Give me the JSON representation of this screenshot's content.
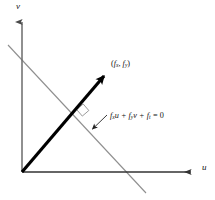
{
  "figure": {
    "width": 215,
    "height": 200,
    "background_color": "#ffffff"
  },
  "axes": {
    "vertical": {
      "label": "v",
      "color": "#6b6b6b",
      "origin": [
        22,
        172
      ],
      "tip": [
        22,
        18
      ],
      "has_arrowhead": true
    },
    "horizontal": {
      "label": "u",
      "color": "#333333",
      "origin": [
        22,
        172
      ],
      "tip": [
        196,
        172
      ],
      "has_arrowhead": true
    }
  },
  "vector": {
    "name": "gradient-vector",
    "label_open_paren": "(",
    "label_f": "f",
    "label_sub_x": "x",
    "label_comma": ", ",
    "label_f2": "f",
    "label_sub_y": "y",
    "label_close_paren": ")",
    "label_plain": "(fx, fy)",
    "color": "#000000",
    "from": [
      22,
      172
    ],
    "to": [
      108,
      72
    ],
    "stroke_width": 3.2,
    "has_arrowhead": true
  },
  "constraint_line": {
    "name": "brightness-constancy-constraint-line",
    "equation_plain": "fx u + fy v + ft = 0",
    "equation_parts": {
      "f1": "f",
      "sub1": "x",
      "var1": "u",
      "plus1": " + ",
      "f2": "f",
      "sub2": "y",
      "var2": "v",
      "plus2": " + ",
      "f3": "f",
      "sub3": "t",
      "equals": " = 0"
    },
    "color": "#8f8f8f",
    "from": [
      8,
      45
    ],
    "to": [
      146,
      193
    ],
    "stroke_width": 1.1
  },
  "intersection": {
    "name": "perpendicular-foot",
    "point": [
      82.5,
      110.5
    ],
    "right_angle_marker": true,
    "marker_color": "#8f8f8f"
  },
  "leader": {
    "name": "equation-leader-line",
    "from": [
      107,
      115
    ],
    "to": [
      90,
      131
    ],
    "color": "#222222",
    "has_arrowhead": true
  },
  "colors": {
    "ink": "#111111",
    "axis_gray": "#6b6b6b",
    "line_gray": "#8f8f8f",
    "vector_black": "#000000",
    "background": "#ffffff"
  }
}
